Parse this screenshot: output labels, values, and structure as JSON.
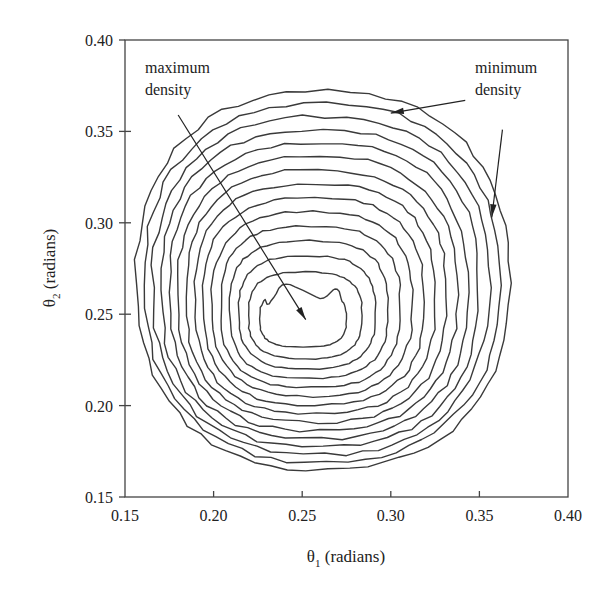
{
  "chart_data": {
    "type": "contour",
    "title": "",
    "xlabel": "θ1 (radians)",
    "ylabel": "θ2 (radians)",
    "xlabel_parts": {
      "symbol": "θ",
      "sub": "1",
      "rest": " (radians)"
    },
    "ylabel_parts": {
      "symbol": "θ",
      "sub": "2",
      "rest": " (radians)"
    },
    "xlim": [
      0.15,
      0.4
    ],
    "ylim": [
      0.15,
      0.4
    ],
    "xticks": [
      "0.15",
      "0.20",
      "0.25",
      "0.30",
      "0.35",
      "0.40"
    ],
    "yticks": [
      "0.15",
      "0.20",
      "0.25",
      "0.30",
      "0.35",
      "0.40"
    ],
    "grid": false,
    "legend": null,
    "contour_levels": 15,
    "peak": {
      "x": 0.255,
      "y": 0.247
    },
    "outer_contour_extent": {
      "x": [
        0.159,
        0.37
      ],
      "y": [
        0.163,
        0.371
      ]
    },
    "inner_contour_extent": {
      "x": [
        0.226,
        0.275
      ],
      "y": [
        0.232,
        0.263
      ]
    },
    "annotations": [
      {
        "text_lines": [
          "maximum",
          "density"
        ],
        "text_pos": [
          0.163,
          0.385
        ],
        "arrow_from": [
          0.18,
          0.359
        ],
        "arrow_to": [
          0.252,
          0.247
        ]
      },
      {
        "text_lines": [
          "minimum",
          "density"
        ],
        "text_pos": [
          0.319,
          0.385
        ],
        "arrow_from": [
          0.342,
          0.367
        ],
        "arrow_to": [
          0.3,
          0.36
        ]
      },
      {
        "text_lines": [],
        "arrow_from": [
          0.363,
          0.351
        ],
        "arrow_to": [
          0.357,
          0.303
        ]
      }
    ]
  },
  "annotations": {
    "max_line1": "maximum",
    "max_line2": "density",
    "min_line1": "minimum",
    "min_line2": "density"
  },
  "axes": {
    "x_symbol": "θ",
    "x_sub": "1",
    "x_rest": " (radians)",
    "y_symbol": "θ",
    "y_sub": "2",
    "y_rest": " (radians)"
  }
}
